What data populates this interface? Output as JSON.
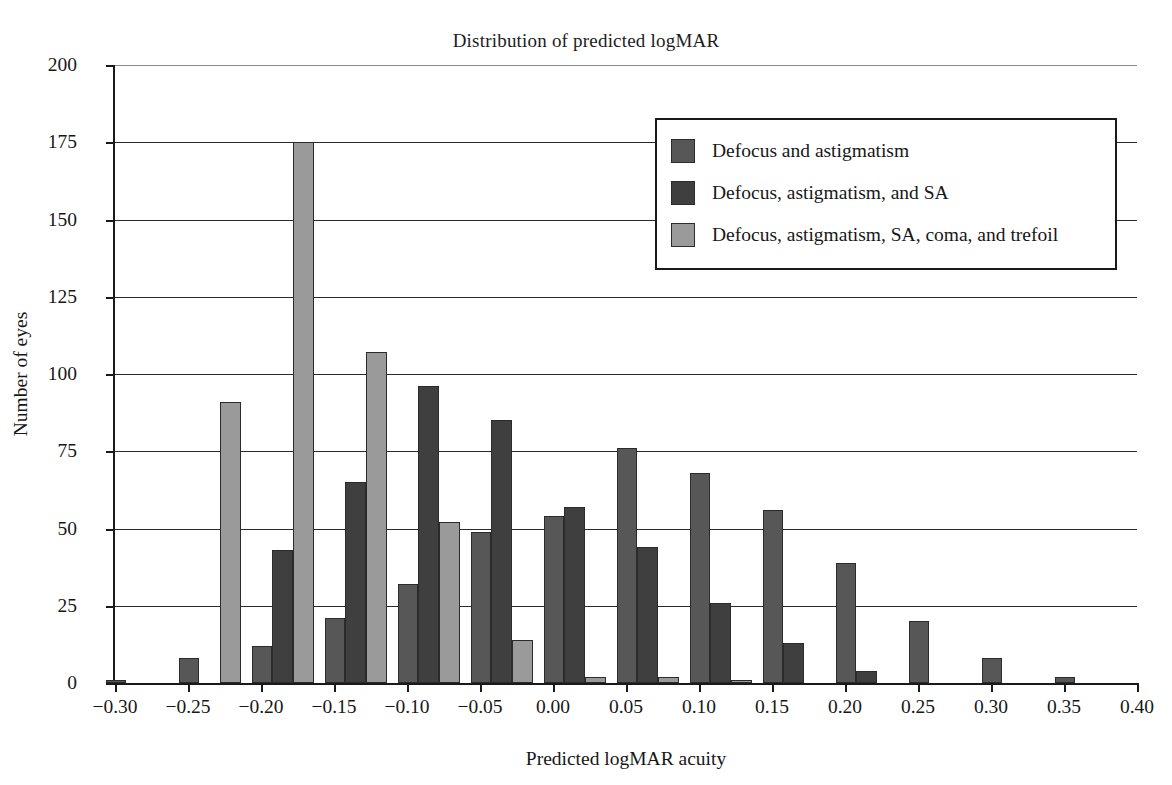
{
  "chart_data": {
    "type": "bar",
    "title": "Distribution of predicted logMAR",
    "xlabel": "Predicted logMAR acuity",
    "ylabel": "Number of eyes",
    "xlim": [
      -0.3,
      0.4
    ],
    "ylim": [
      0,
      200
    ],
    "ytick_labels": [
      "0",
      "25",
      "50",
      "75",
      "100",
      "125",
      "150",
      "175",
      "200"
    ],
    "ytick_values": [
      0,
      25,
      50,
      75,
      100,
      125,
      150,
      175,
      200
    ],
    "xtick_labels": [
      "−0.30",
      "−0.25",
      "−0.20",
      "−0.15",
      "−0.10",
      "−0.05",
      "0.00",
      "0.05",
      "0.10",
      "0.15",
      "0.20",
      "0.25",
      "0.30",
      "0.35",
      "0.40"
    ],
    "xtick_values": [
      -0.3,
      -0.25,
      -0.2,
      -0.15,
      -0.1,
      -0.05,
      0.0,
      0.05,
      0.1,
      0.15,
      0.2,
      0.25,
      0.3,
      0.35,
      0.4
    ],
    "grid": true,
    "legend_position": "upper right",
    "bin_centers": [
      -0.285,
      -0.235,
      -0.185,
      -0.135,
      -0.085,
      -0.035,
      0.015,
      0.065,
      0.115,
      0.165,
      0.215,
      0.265,
      0.315,
      0.365
    ],
    "categories": [
      "−0.285",
      "−0.235",
      "−0.185",
      "−0.135",
      "−0.085",
      "−0.035",
      "0.015",
      "0.065",
      "0.115",
      "0.165",
      "0.215",
      "0.265",
      "0.315",
      "0.365"
    ],
    "series": [
      {
        "name": "Defocus and astigmatism",
        "color": "#575757",
        "values": [
          1,
          8,
          12,
          21,
          32,
          49,
          54,
          76,
          68,
          56,
          39,
          20,
          8,
          2
        ]
      },
      {
        "name": "Defocus, astigmatism, and SA",
        "color": "#3f3f3f",
        "values": [
          0,
          0,
          43,
          65,
          96,
          85,
          57,
          44,
          26,
          13,
          4,
          0,
          0,
          0
        ]
      },
      {
        "name": "Defocus, astigmatism, SA, coma, and trefoil",
        "color": "#9a9a9a",
        "values": [
          0,
          91,
          175,
          107,
          52,
          14,
          2,
          2,
          1,
          0,
          0,
          0,
          0,
          0
        ]
      }
    ]
  },
  "legend": {
    "items": [
      {
        "label": "Defocus and astigmatism"
      },
      {
        "label": "Defocus, astigmatism, and SA"
      },
      {
        "label": "Defocus, astigmatism, SA, coma, and trefoil"
      }
    ]
  }
}
